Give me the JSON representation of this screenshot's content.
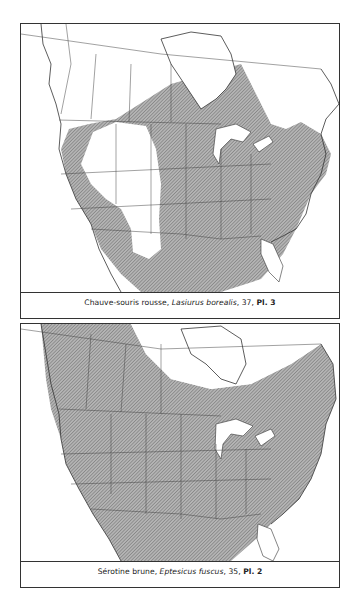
{
  "maps": [
    {
      "id": "top",
      "species_common": "Chauve-souris rousse",
      "species_latin": "Lasiurus borealis",
      "page": "37",
      "plate": "Pl. 3",
      "range_description": "Shaded range across eastern North America from southern Canada to Mexico; unshaded Great Basin / Rocky Mountain interior west and northern Canada"
    },
    {
      "id": "bottom",
      "species_common": "Sérotine brune",
      "species_latin": "Eptesicus fuscus",
      "page": "35",
      "plate": "Pl. 2",
      "range_description": "Shaded range covering nearly all of the contiguous United States, southern Canada and Mexico; unshaded far north and southern Florida"
    }
  ],
  "caption_separators": {
    "comma": ", ",
    "page_sep": ", "
  },
  "colors": {
    "range_fill": "#a8a8a8",
    "hatch": "#7a7a7a",
    "border": "#333333",
    "background": "#ffffff"
  }
}
